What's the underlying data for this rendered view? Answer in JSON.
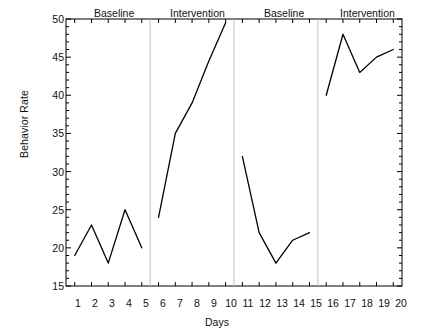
{
  "chart_data": {
    "type": "line",
    "title": "",
    "xlabel": "Days",
    "ylabel": "Behavior Rate",
    "xlim": [
      1,
      20
    ],
    "ylim": [
      15,
      50
    ],
    "grid": false,
    "legend": "none",
    "x_ticks": [
      "1",
      "2",
      "3",
      "4",
      "5",
      "6",
      "7",
      "8",
      "9",
      "10",
      "11",
      "12",
      "13",
      "14",
      "15",
      "16",
      "17",
      "18",
      "19",
      "20"
    ],
    "y_ticks": [
      "15",
      "20",
      "25",
      "30",
      "35",
      "40",
      "45",
      "50"
    ],
    "x": [
      1,
      2,
      3,
      4,
      5,
      6,
      7,
      8,
      9,
      10,
      11,
      12,
      13,
      14,
      15,
      16,
      17,
      18,
      19,
      20
    ],
    "values": [
      19,
      23,
      18,
      25,
      20,
      24,
      35,
      39,
      44.5,
      49.5,
      32,
      22,
      18,
      21,
      22,
      40,
      48,
      43,
      45,
      46
    ],
    "phases": [
      {
        "label": "Baseline",
        "start_day": 1,
        "end_day": 5,
        "values": [
          19,
          23,
          18,
          25,
          20
        ]
      },
      {
        "label": "Intervention",
        "start_day": 6,
        "end_day": 10,
        "values": [
          24,
          35,
          39,
          44.5,
          49.5
        ]
      },
      {
        "label": "Baseline",
        "start_day": 11,
        "end_day": 15,
        "values": [
          32,
          22,
          18,
          21,
          22
        ]
      },
      {
        "label": "Intervention",
        "start_day": 16,
        "end_day": 20,
        "values": [
          40,
          48,
          43,
          45,
          46
        ]
      }
    ],
    "phase_dividers": [
      5.5,
      10.5,
      15.5
    ],
    "line_color": "#000000",
    "divider_color": "#bfbfbf",
    "axis_color": "#000000",
    "background_color": "#ffffff"
  }
}
